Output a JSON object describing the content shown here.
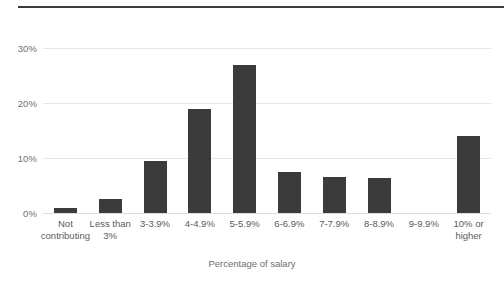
{
  "chart_data": {
    "type": "bar",
    "title": "",
    "subtitle": "",
    "xlabel": "Percentage of salary",
    "ylabel": "",
    "categories": [
      "Not contributing",
      "Less than 3%",
      "3-3.9%",
      "4-4.9%",
      "5-5.9%",
      "6-6.9%",
      "7-7.9%",
      "8-8.9%",
      "9-9.9%",
      "10% or higher"
    ],
    "values": [
      1.0,
      2.5,
      9.5,
      19.0,
      27.0,
      7.5,
      6.5,
      6.3,
      0.0,
      14.0
    ],
    "ylim": [
      0,
      31.5
    ],
    "yticks": [
      0,
      10,
      20,
      30
    ],
    "ytick_labels": [
      "0%",
      "10%",
      "20%",
      "30%"
    ],
    "grid": true,
    "legend": false,
    "bar_color": "#3b3b3b",
    "gridline_color": "#e6e6e6",
    "tick_label_color": "#5a5a5a"
  },
  "axes": {
    "y_ticks": [
      {
        "label": "30%",
        "value": 30
      },
      {
        "label": "20%",
        "value": 20
      },
      {
        "label": "10%",
        "value": 10
      },
      {
        "label": "0%",
        "value": 0
      }
    ],
    "x_ticks": [
      {
        "label": "Not contributing"
      },
      {
        "label": "Less than 3%"
      },
      {
        "label": "3-3.9%"
      },
      {
        "label": "4-4.9%"
      },
      {
        "label": "5-5.9%"
      },
      {
        "label": "6-6.9%"
      },
      {
        "label": "7-7.9%"
      },
      {
        "label": "8-8.9%"
      },
      {
        "label": "9-9.9%"
      },
      {
        "label": "10% or higher"
      }
    ],
    "x_axis_title": "Percentage of salary"
  }
}
